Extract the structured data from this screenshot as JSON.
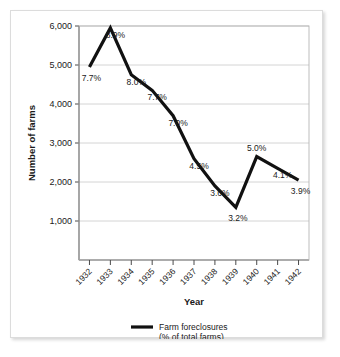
{
  "chart_data": {
    "type": "line",
    "title": "",
    "subtitle": "",
    "xlabel": "Year",
    "ylabel": "Number of farms",
    "categories": [
      "1932",
      "1933",
      "1934",
      "1935",
      "1936",
      "1937",
      "1938",
      "1939",
      "1940",
      "1941",
      "1942"
    ],
    "x": [
      1932,
      1933,
      1934,
      1935,
      1936,
      1937,
      1938,
      1939,
      1940,
      1941,
      1942
    ],
    "series": [
      {
        "name": "Farm foreclosures (% of total farms)",
        "values": [
          4950,
          5950,
          4750,
          4350,
          3700,
          2600,
          1900,
          1350,
          2650,
          2350,
          2050
        ],
        "color": "#111111",
        "point_labels": [
          "7.7%",
          "8.9%",
          "8.0%",
          "7.7%",
          "7.0%",
          "4.5%",
          "3.6%",
          "3.2%",
          "5.0%",
          "4.1%",
          "3.9%"
        ]
      }
    ],
    "point_label_positions": [
      "below",
      "right",
      "right",
      "right",
      "right",
      "right",
      "right",
      "below",
      "above",
      "right",
      "below"
    ],
    "ylim": [
      0,
      6000
    ],
    "yticks": [
      1000,
      2000,
      3000,
      4000,
      5000,
      6000
    ],
    "ytick_labels": [
      "1,000",
      "2,000",
      "3,000",
      "4,000",
      "5,000",
      "6,000"
    ],
    "grid": true,
    "grid_axis": "y",
    "legend_position": "bottom-center",
    "xtick_label_rotation": 45,
    "axis_color": "#4a4a4a",
    "grid_color": "#c9c9c9"
  },
  "legend": {
    "line1": "Farm foreclosures",
    "line2": "(% of total farms)"
  },
  "axes": {
    "y_title": "Number of farms",
    "x_title": "Year"
  }
}
